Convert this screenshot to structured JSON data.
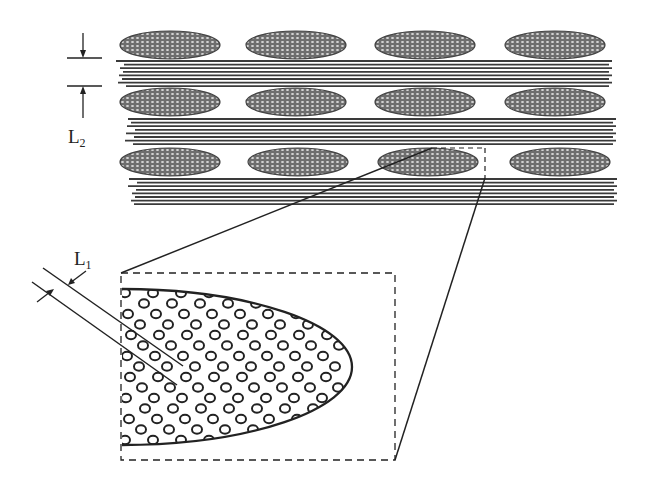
{
  "labels": {
    "L2": {
      "main": "L",
      "sub": "2"
    },
    "L1": {
      "main": "L",
      "sub": "1"
    }
  },
  "colors": {
    "ink": "#222222",
    "ellipse_fill": "#6e6e6e",
    "ellipse_dot": "#d8d8d8",
    "fiber": "#3a3a3a",
    "background": "#ffffff"
  },
  "top_panel": {
    "description": "Layered composite: rows of elliptical fiber-bundle cross-sections alternating with longitudinal fiber layers",
    "ellipse_rows": [
      {
        "cy": 45,
        "cx": [
          170,
          296,
          425,
          555
        ],
        "rx": 50,
        "ry": 14
      },
      {
        "cy": 102,
        "cx": [
          170,
          296,
          425,
          555
        ],
        "rx": 50,
        "ry": 14
      },
      {
        "cy": 162,
        "cx": [
          170,
          298,
          428,
          560
        ],
        "rx": 50,
        "ry": 14
      }
    ],
    "fiber_layers": [
      {
        "y0": 61,
        "x0": 118,
        "x1": 612,
        "count": 8,
        "spacing": 3.6
      },
      {
        "y0": 119,
        "x0": 127,
        "x1": 616,
        "count": 8,
        "spacing": 3.6
      },
      {
        "y0": 179,
        "x0": 130,
        "x1": 617,
        "count": 8,
        "spacing": 3.6
      }
    ],
    "detail_box": {
      "x": 432,
      "y": 148,
      "x2": 485,
      "y2": 178
    }
  },
  "dimension_L2": {
    "line_top_y": 58,
    "line_bottom_y": 86,
    "x0": 67,
    "x1": 102,
    "arrow_x": 83
  },
  "detail_panel": {
    "box": {
      "x": 121,
      "y": 273,
      "w": 274,
      "h": 187
    },
    "ellipse_outline": {
      "top_y": 289,
      "bottom_y": 445,
      "left_x": 122,
      "tip_x": 352,
      "tip_y": 367
    },
    "circle_radius": 5
  },
  "dimension_L1": {
    "upper_line": [
      43,
      268,
      183,
      366
    ],
    "lower_line": [
      32,
      282,
      177,
      385
    ]
  }
}
